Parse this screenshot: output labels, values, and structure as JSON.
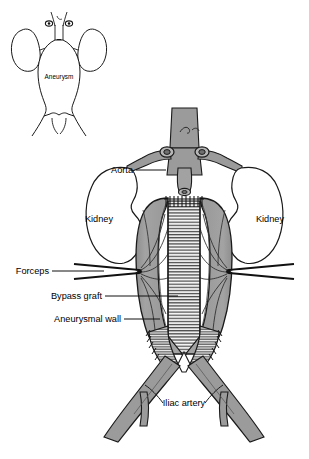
{
  "figure": {
    "background_color": "#ffffff",
    "outline_color": "#000000",
    "vessel_fill": "#9b9b9b",
    "sac_fill": "#9a9a9a",
    "graft_fill": "#f2f2f2",
    "organ_fill": "#ffffff",
    "leader_color": "#000000"
  },
  "inset": {
    "name": "preoperative-aneurysm-inset",
    "label": "Aneurysm",
    "description": "Line drawing of intact abdominal aortic aneurysm with kidneys and renal arteries"
  },
  "main": {
    "labels": {
      "aorta": "Aorta",
      "kidney_left": "Kidney",
      "kidney_right": "Kidney",
      "forceps": "Forceps",
      "bypass_graft": "Bypass graft",
      "aneurysmal_wall": "Aneurysmal wall",
      "iliac_artery": "Iliac artery"
    }
  },
  "structures": [
    {
      "id": "aorta",
      "label": "Aorta",
      "fill": "#9b9b9b"
    },
    {
      "id": "kidney-left",
      "label": "Kidney",
      "fill": "#ffffff"
    },
    {
      "id": "kidney-right",
      "label": "Kidney",
      "fill": "#ffffff"
    },
    {
      "id": "renal-artery-left",
      "label": "Renal artery",
      "fill": "#9b9b9b"
    },
    {
      "id": "renal-artery-right",
      "label": "Renal artery",
      "fill": "#9b9b9b"
    },
    {
      "id": "aneurysmal-wall",
      "label": "Aneurysmal wall",
      "fill": "#9a9a9a"
    },
    {
      "id": "bypass-graft",
      "label": "Bypass graft",
      "fill": "#f2f2f2"
    },
    {
      "id": "forceps-left",
      "label": "Forceps",
      "fill": "#1a1a1a"
    },
    {
      "id": "forceps-right",
      "label": "Forceps",
      "fill": "#1a1a1a"
    },
    {
      "id": "iliac-artery-left",
      "label": "Iliac artery",
      "fill": "#9b9b9b"
    },
    {
      "id": "iliac-artery-right",
      "label": "Iliac artery",
      "fill": "#9b9b9b"
    }
  ]
}
